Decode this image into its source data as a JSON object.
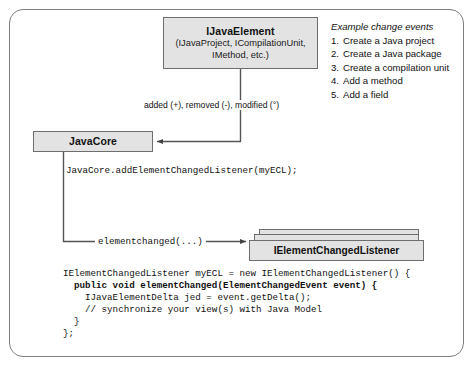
{
  "diagram": {
    "nodes": {
      "java_element": {
        "title": "IJavaElement",
        "subtitle_line1": "(IJavaProject, ICompilationUnit,",
        "subtitle_line2": "IMethod, etc.)"
      },
      "java_core": {
        "title": "JavaCore"
      },
      "listener": {
        "title": "IElementChangedListener"
      }
    },
    "edges": {
      "delta_label": "added (+), removed (-), modified (°)",
      "add_listener_call": "JavaCore.addElementChangedListener(myECL);",
      "element_changed_call": "elementchanged(...)"
    },
    "code": {
      "lines": [
        "IElementChangedListener myECL = new IElementChangedListener() {",
        "  public void elementChanged(ElementChangedEvent event) {",
        "    IJavaElementDelta jed = event.getDelta();",
        "    // synchronize your view(s) with Java Model",
        "  }",
        "};"
      ]
    },
    "examples": {
      "heading": "Example change events",
      "items": [
        {
          "num": "1.",
          "text": "Create a Java project"
        },
        {
          "num": "2.",
          "text": "Create a Java package"
        },
        {
          "num": "3.",
          "text": "Create a compilation unit"
        },
        {
          "num": "4.",
          "text": "Add a method"
        },
        {
          "num": "5.",
          "text": "Add a field"
        }
      ]
    },
    "colors": {
      "node_fill": "#e3e3e3",
      "node_stroke": "#6e6e6e",
      "frame_stroke": "#7d7d7d",
      "wire": "#555555",
      "text": "#111111"
    }
  }
}
